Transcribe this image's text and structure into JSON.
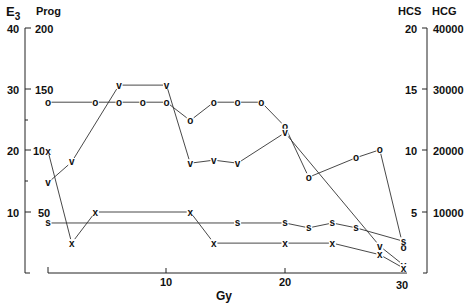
{
  "chart_data": {
    "type": "line",
    "title": "",
    "xlabel": "Gy",
    "x_ticks": [
      10,
      20,
      30
    ],
    "xlim": [
      0,
      30
    ],
    "axes": {
      "left_outer": {
        "label": "E3",
        "ticks": [
          10,
          20,
          30,
          40
        ],
        "range": [
          0,
          40
        ]
      },
      "left_inner": {
        "label": "Prog",
        "ticks": [
          50,
          100,
          150,
          200
        ],
        "range": [
          0,
          200
        ]
      },
      "right_inner": {
        "label": "HCS",
        "ticks": [
          5,
          10,
          15,
          20
        ],
        "range": [
          0,
          20
        ]
      },
      "right_outer": {
        "label": "HCG",
        "ticks": [
          10000,
          20000,
          30000,
          40000
        ],
        "range": [
          0,
          40000
        ]
      }
    },
    "grid": false,
    "legend": "none (series marked by plot symbols o, v, x, s)",
    "series": [
      {
        "name": "o",
        "marker": "o",
        "units": "E3-scale",
        "x": [
          0,
          4,
          6,
          8,
          10,
          12,
          14,
          16,
          18,
          20,
          22,
          26,
          28,
          30
        ],
        "values": [
          28,
          28,
          28,
          28,
          28,
          25,
          28,
          28,
          28,
          24,
          15.7,
          18.9,
          20.2,
          4.1
        ]
      },
      {
        "name": "v",
        "marker": "v",
        "units": "E3-scale",
        "x": [
          0,
          2,
          6,
          10,
          12,
          14,
          16,
          20,
          28,
          30
        ],
        "values": [
          14.8,
          18.2,
          30.8,
          30.8,
          18.0,
          18.5,
          18.0,
          23.0,
          4.4,
          1.3
        ]
      },
      {
        "name": "x",
        "marker": "x",
        "units": "E3-scale",
        "x": [
          0,
          2,
          4,
          12,
          14,
          20,
          24,
          28,
          30
        ],
        "values": [
          20,
          4.9,
          10,
          10,
          4.9,
          4.9,
          4.9,
          3.0,
          0.8
        ]
      },
      {
        "name": "s",
        "marker": "s",
        "units": "E3-scale",
        "x": [
          0,
          16,
          20,
          22,
          24,
          26,
          30
        ],
        "values": [
          8.2,
          8.2,
          8.2,
          7.4,
          8.2,
          7.4,
          5.2
        ]
      }
    ]
  },
  "labels": {
    "e3": "E",
    "e3_sub": "3",
    "prog": "Prog",
    "hcs": "HCS",
    "hcg": "HCG",
    "gy": "Gy",
    "left_outer_ticks": [
      "40",
      "30",
      "20",
      "10"
    ],
    "left_inner_ticks": [
      "200",
      "150",
      "100",
      "50"
    ],
    "right_inner_ticks": [
      "20",
      "15",
      "10",
      "5"
    ],
    "right_outer_ticks": [
      "40000",
      "30000",
      "20000",
      "10000"
    ],
    "x_ticks": [
      "10",
      "20",
      "30"
    ]
  }
}
